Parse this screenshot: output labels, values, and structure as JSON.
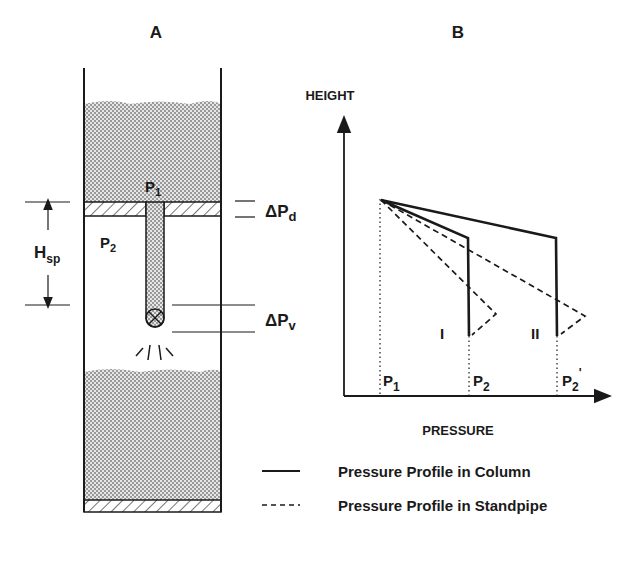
{
  "panel_a": {
    "title": "A",
    "labels": {
      "p1": "P",
      "p1_sub": "1",
      "p2": "P",
      "p2_sub": "2",
      "hsp": "H",
      "hsp_sub": "sp",
      "dpd": "ΔP",
      "dpd_sub": "d",
      "dpv": "ΔP",
      "dpv_sub": "v"
    }
  },
  "panel_b": {
    "title": "B",
    "y_axis_label": "HEIGHT",
    "x_axis_label": "PRESSURE",
    "tick_labels": {
      "p1": "P",
      "p1_sub": "1",
      "p2": "P",
      "p2_sub": "2",
      "p2p": "P",
      "p2p_sub": "2",
      "p2p_prime": "'"
    },
    "case_labels": [
      "I",
      "II"
    ]
  },
  "legend": {
    "items": [
      {
        "style": "solid",
        "label": "Pressure Profile in Column"
      },
      {
        "style": "dashed",
        "label": "Pressure Profile in Standpipe"
      }
    ]
  },
  "colors": {
    "ink": "#1a1a1a",
    "fill_pattern": "#8a8a8a",
    "background": "#ffffff"
  }
}
